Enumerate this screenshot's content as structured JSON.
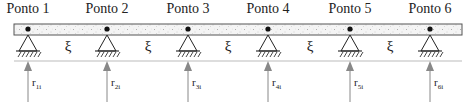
{
  "diagram": {
    "title": "",
    "beam": {
      "fill": "#f3f3f3",
      "stroke": "#444444"
    },
    "points": [
      {
        "label": "Ponto 1",
        "x": 28,
        "reaction": "r",
        "reaction_sub": "1i"
      },
      {
        "label": "Ponto 2",
        "x": 107,
        "reaction": "r",
        "reaction_sub": "2i"
      },
      {
        "label": "Ponto 3",
        "x": 188,
        "reaction": "r",
        "reaction_sub": "3i"
      },
      {
        "label": "Ponto 4",
        "x": 268,
        "reaction": "r",
        "reaction_sub": "4i"
      },
      {
        "label": "Ponto 5",
        "x": 350,
        "reaction": "r",
        "reaction_sub": "5i"
      },
      {
        "label": "Ponto 6",
        "x": 430,
        "reaction": "r",
        "reaction_sub": "6i"
      }
    ],
    "spans": [
      {
        "symbol": "ξ",
        "x": 68
      },
      {
        "symbol": "ξ",
        "x": 148
      },
      {
        "symbol": "ξ",
        "x": 228
      },
      {
        "symbol": "ξ",
        "x": 310
      },
      {
        "symbol": "ξ",
        "x": 390
      }
    ],
    "arrow_color": "#888888"
  }
}
